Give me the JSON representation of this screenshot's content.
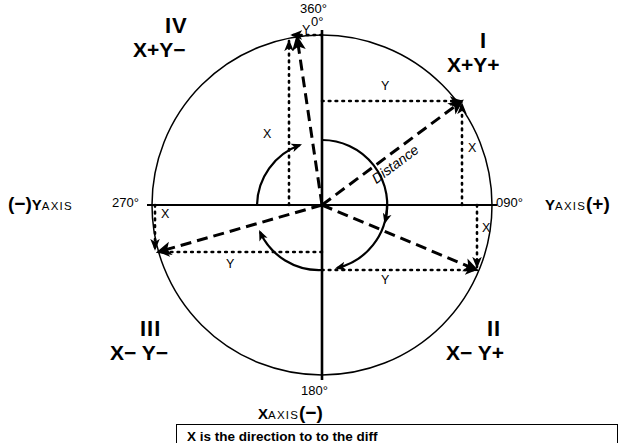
{
  "figure": {
    "type": "polar-quadrant-diagram",
    "center": {
      "x": 322,
      "y": 205
    },
    "outer_radius": 170,
    "inner_radius": 65,
    "degree_labels": [
      {
        "name": "deg-360",
        "text": "360°",
        "x": 300,
        "y": 2
      },
      {
        "name": "deg-000",
        "text": "0°",
        "x": 310,
        "y": 15
      },
      {
        "name": "deg-090",
        "text": "090°",
        "x": 496,
        "y": 195
      },
      {
        "name": "deg-180",
        "text": "180°",
        "x": 300,
        "y": 385
      },
      {
        "name": "deg-270",
        "text": "270°",
        "x": 112,
        "y": 195
      }
    ],
    "quadrants": [
      {
        "name": "quadrant-1",
        "numeral": "I",
        "signs": "X+Y+",
        "num_x": 469,
        "num_y": 33,
        "sign_x": 440,
        "sign_y": 55
      },
      {
        "name": "quadrant-2",
        "numeral": "II",
        "signs": "X− Y+",
        "num_x": 483,
        "num_y": 322,
        "sign_x": 443,
        "sign_y": 344
      },
      {
        "name": "quadrant-3",
        "numeral": "III",
        "signs": "X− Y−",
        "num_x": 136,
        "num_y": 322,
        "sign_x": 108,
        "sign_y": 344
      },
      {
        "name": "quadrant-4",
        "numeral": "IV",
        "signs": "X+Y−",
        "num_x": 160,
        "num_y": 18,
        "sign_x": 133,
        "sign_y": 40
      }
    ],
    "axis_labels": [
      {
        "name": "y-axis-negative-label",
        "lead_sign": "(−)",
        "letter": "Y",
        "word": "AXIS",
        "trail_sign": "",
        "x": 6,
        "y": 194
      },
      {
        "name": "y-axis-positive-label",
        "lead_sign": "",
        "letter": "Y",
        "word": "AXIS",
        "trail_sign": "(+)",
        "x": 545,
        "y": 194
      },
      {
        "name": "x-axis-negative-label",
        "lead_sign": "",
        "letter": "X",
        "word": "AXIS",
        "trail_sign": "(−)",
        "x": 258,
        "y": 404
      }
    ],
    "vectors": [
      {
        "name": "vector-quadrant-1",
        "label": "Distance",
        "tip": {
          "x": 462,
          "y": 101
        },
        "component_x_label": "X",
        "component_y_label": "Y",
        "x_label_pos": {
          "x": 468,
          "y": 148
        },
        "y_label_pos": {
          "x": 384,
          "y": 86
        }
      },
      {
        "name": "vector-quadrant-2",
        "label": "",
        "tip": {
          "x": 477,
          "y": 270
        },
        "component_x_label": "X",
        "component_y_label": "Y",
        "x_label_pos": {
          "x": 482,
          "y": 228
        },
        "y_label_pos": {
          "x": 384,
          "y": 277
        }
      },
      {
        "name": "vector-quadrant-3",
        "label": "",
        "tip": {
          "x": 158,
          "y": 252
        },
        "component_x_label": "X",
        "component_y_label": "Y",
        "x_label_pos": {
          "x": 160,
          "y": 213
        },
        "y_label_pos": {
          "x": 228,
          "y": 261
        }
      },
      {
        "name": "vector-quadrant-4",
        "label": "",
        "tip": {
          "x": 297,
          "y": 37
        },
        "component_x_label": "X",
        "component_y_label": "Y",
        "x_label_pos": {
          "x": 266,
          "y": 134
        },
        "y_label_pos": {
          "x": 303,
          "y": 29
        }
      }
    ]
  },
  "caption": {
    "name": "caption-box",
    "text": "X  is  the  dɪʀєctɪоn  to  to  thє  diff",
    "visible_text": "X is the direction to to the diff"
  }
}
